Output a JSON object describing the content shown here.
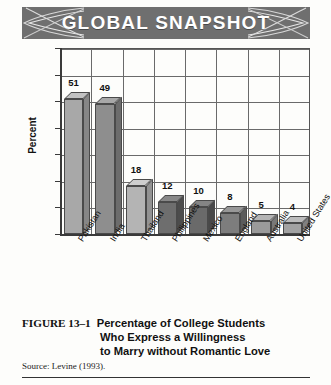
{
  "banner": {
    "title": "GLOBAL SNAPSHOT",
    "background_color": "#6f6f6f",
    "text_color": "#ffffff",
    "left_decoration_icon": "swoosh-ribbon-icon",
    "right_decoration_icon": "swoosh-ribbon-icon"
  },
  "caption": {
    "figure_number": "FIGURE 13–1",
    "line1": "Percentage of College Students",
    "line2": "Who Express a Willingness",
    "line3": "to Marry without Romantic Love",
    "source": "Source: Levine (1993)."
  },
  "chart_data": {
    "type": "bar",
    "title": "Percentage of College Students Who Express a Willingness to Marry without Romantic Love",
    "xlabel": "",
    "ylabel": "Percent",
    "ylim": [
      0,
      70
    ],
    "yticks": [
      0,
      10,
      20,
      30,
      40,
      50,
      60,
      70
    ],
    "grid": true,
    "legend": "none",
    "categories": [
      "Pakistan",
      "India",
      "Thailand",
      "Philippines",
      "Mexico",
      "England",
      "Australia",
      "United States"
    ],
    "values": [
      51,
      49,
      18,
      12,
      10,
      8,
      5,
      4
    ],
    "bar_colors": [
      "#a8a8a8",
      "#8e8e8e",
      "#b4b4b4",
      "#6e6e6e",
      "#6a6a6a",
      "#7d7d7d",
      "#9a9a9a",
      "#a2a2a2"
    ]
  }
}
